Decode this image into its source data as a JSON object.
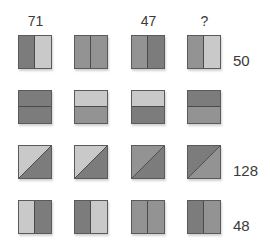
{
  "colors": {
    "dark": "#7c7c7c",
    "medium": "#939393",
    "light": "#c9c9c9",
    "border": "#5a5a5a"
  },
  "columns": [
    {
      "label": "71",
      "x": 18
    },
    {
      "label": "",
      "x": 74
    },
    {
      "label": "47",
      "x": 131
    },
    {
      "label": "?",
      "x": 187
    }
  ],
  "rows": [
    {
      "y": 35,
      "split": "vertical",
      "label": "50",
      "tiles": [
        {
          "a": "dark",
          "b": "light"
        },
        {
          "a": "medium",
          "b": "medium"
        },
        {
          "a": "medium",
          "b": "dark"
        },
        {
          "a": "medium",
          "b": "light"
        }
      ]
    },
    {
      "y": 90,
      "split": "horizontal",
      "label": "",
      "tiles": [
        {
          "a": "dark",
          "b": "dark"
        },
        {
          "a": "light",
          "b": "medium"
        },
        {
          "a": "light",
          "b": "dark"
        },
        {
          "a": "dark",
          "b": "medium"
        }
      ]
    },
    {
      "y": 145,
      "split": "diagonal",
      "label": "128",
      "tiles": [
        {
          "a": "light",
          "b": "dark"
        },
        {
          "a": "light",
          "b": "dark"
        },
        {
          "a": "medium",
          "b": "dark"
        },
        {
          "a": "dark",
          "b": "medium"
        }
      ]
    },
    {
      "y": 200,
      "split": "vertical",
      "label": "48",
      "tiles": [
        {
          "a": "light",
          "b": "dark"
        },
        {
          "a": "dark",
          "b": "light"
        },
        {
          "a": "medium",
          "b": "medium"
        },
        {
          "a": "dark",
          "b": "medium"
        }
      ]
    }
  ],
  "question_mark": "?"
}
